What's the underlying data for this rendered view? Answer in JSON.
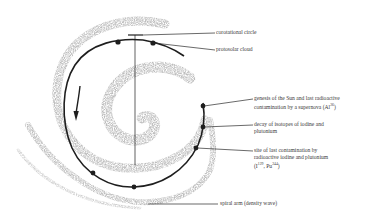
{
  "diagram": {
    "type": "spiral galaxy schematic with corotational circle",
    "colors": {
      "spiral_arm": "#bdbdbd",
      "orbit_line": "#1e1e1e",
      "leader_line": "#2a2a2a",
      "text": "#3a3a3a",
      "background": "#ffffff"
    },
    "labels": {
      "corotational_circle": "corotational circle",
      "protosolar_cloud": "protosolar cloud",
      "genesis_line1": "genesis of the Sun and last radioactive",
      "genesis_line2": "contamination by a supernova (Al",
      "genesis_sup": "26",
      "genesis_end": ")",
      "decay_line1": "decay of isotopes of iodine and",
      "decay_line2": "plutonium",
      "site_line1": "site of last contamination by",
      "site_line2": "radioactive iodine and plutonium",
      "site_i": "(I",
      "site_i_sup": "129",
      "site_pu": ", Pu",
      "site_pu_sup": "244",
      "site_end": ")",
      "spiral_arm": "spiral arm (density wave)"
    },
    "markers": [
      {
        "name": "marker-top-left",
        "x": 118,
        "y": 42
      },
      {
        "name": "marker-top-right",
        "x": 153,
        "y": 43
      },
      {
        "name": "marker-genesis",
        "x": 203,
        "y": 106
      },
      {
        "name": "marker-decay",
        "x": 203,
        "y": 127
      },
      {
        "name": "marker-site",
        "x": 196,
        "y": 148
      },
      {
        "name": "marker-bottom-left",
        "x": 93,
        "y": 173
      },
      {
        "name": "marker-bottom",
        "x": 134,
        "y": 187
      }
    ],
    "direction_arrow": "clockwise-rotation (downward on left side)"
  }
}
